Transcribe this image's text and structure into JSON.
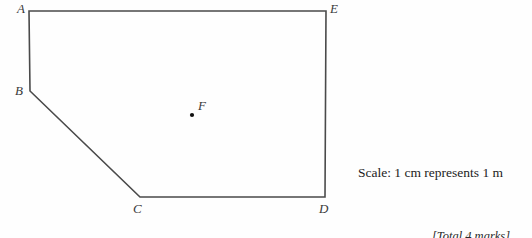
{
  "page": {
    "background_color": "#fefefe",
    "width": 532,
    "height": 238
  },
  "diagram": {
    "name": "scale-drawing-pentagon",
    "stroke_color": "#4a4a4a",
    "stroke_width": 1.6,
    "fill": "none",
    "vertices": [
      {
        "label": "A",
        "x": 29,
        "y": 11,
        "label_x": 17,
        "label_y": 2
      },
      {
        "label": "E",
        "x": 326,
        "y": 11,
        "label_x": 330,
        "label_y": 2
      },
      {
        "label": "D",
        "x": 325,
        "y": 197,
        "label_x": 319,
        "label_y": 202
      },
      {
        "label": "C",
        "x": 140,
        "y": 197,
        "label_x": 133,
        "label_y": 202
      },
      {
        "label": "B",
        "x": 30,
        "y": 91,
        "label_x": 15,
        "label_y": 84
      }
    ],
    "interior_points": [
      {
        "label": "F",
        "x": 192,
        "y": 115,
        "label_x": 198,
        "label_y": 99,
        "dot_radius": 2.1,
        "dot_color": "#101010"
      }
    ],
    "edges": [
      {
        "from": "A",
        "to": "E"
      },
      {
        "from": "E",
        "to": "D"
      },
      {
        "from": "D",
        "to": "C"
      },
      {
        "from": "C",
        "to": "B"
      },
      {
        "from": "B",
        "to": "A"
      }
    ]
  },
  "annotations": {
    "scale_note": "Scale: 1 cm represents 1 m",
    "scale_note_x": 358,
    "scale_note_y": 166,
    "marks_note": "[Total 4 marks]",
    "marks_note_x": 432,
    "marks_note_y": 230
  }
}
